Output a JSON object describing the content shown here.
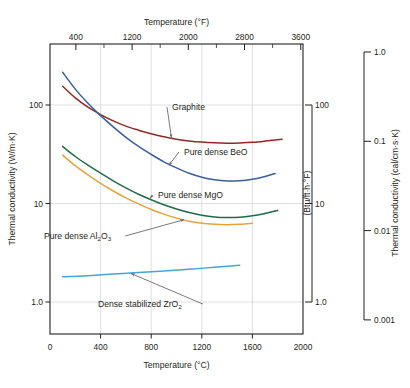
{
  "chart_data": {
    "type": "line",
    "title": "",
    "xlabel": "Temperature (°C)",
    "ylabel": "Thermal conductivity (W/m·K)",
    "xlim": [
      0,
      2000
    ],
    "ylim": [
      0.55,
      400
    ],
    "yscale": "log",
    "grid": true,
    "legend_position": "inline-annotations",
    "axes": {
      "bottom": {
        "label": "Temperature (°C)",
        "ticks": [
          0,
          400,
          800,
          1200,
          1600,
          2000
        ],
        "tick_labels": [
          "0",
          "400",
          "800",
          "1200",
          "1600",
          "2000"
        ]
      },
      "top": {
        "label": "Temperature (°F)",
        "ticks": [
          400,
          1200,
          2000,
          2800,
          3600
        ],
        "tick_labels": [
          "400",
          "1200",
          "2000",
          "2800",
          "3600"
        ],
        "minor_ticks": [
          800,
          1600,
          2400,
          3200
        ]
      },
      "left": {
        "label": "Thermal conductivity (W/m·K)",
        "ticks": [
          100,
          10,
          1.0
        ],
        "tick_labels": [
          "100",
          "10",
          "1.0"
        ]
      },
      "right_inner": {
        "label": "(Btu/ft·h·°F)",
        "ticks": [
          100,
          10,
          1.0
        ],
        "tick_labels": [
          "100",
          "10",
          "1.0"
        ]
      },
      "right_outer": {
        "label": "Thermal conductivity (cal/cm·s·K)",
        "ticks": [
          1.0,
          0.1,
          0.01,
          0.001
        ],
        "tick_labels": [
          "1.0",
          "0.1",
          "0.01",
          "0.001"
        ]
      }
    },
    "series": [
      {
        "name": "Graphite",
        "label": "Graphite",
        "color": "#8e2b24",
        "x": [
          100,
          200,
          300,
          400,
          500,
          600,
          700,
          800,
          900,
          1000,
          1100,
          1200,
          1300,
          1400,
          1500,
          1600,
          1700,
          1835
        ],
        "y": [
          155,
          118,
          95,
          80,
          69,
          61,
          55.5,
          51,
          47.5,
          45,
          43.2,
          42,
          41.3,
          41,
          41.2,
          41.8,
          43,
          45
        ]
      },
      {
        "name": "Pure dense BeO",
        "label": "Pure dense BeO",
        "color": "#3a5f9e",
        "x": [
          100,
          200,
          300,
          400,
          500,
          600,
          700,
          800,
          900,
          1000,
          1100,
          1200,
          1300,
          1400,
          1500,
          1600,
          1700,
          1780
        ],
        "y": [
          215,
          145,
          104,
          78,
          60,
          47,
          38,
          31.5,
          26.5,
          23,
          20.3,
          18.5,
          17.4,
          16.9,
          17.0,
          17.6,
          18.8,
          20.2
        ]
      },
      {
        "name": "Pure dense MgO",
        "label": "Pure dense MgO",
        "color": "#1f6b45",
        "x": [
          100,
          200,
          300,
          400,
          500,
          600,
          700,
          800,
          900,
          1000,
          1100,
          1200,
          1300,
          1400,
          1500,
          1600,
          1700,
          1800
        ],
        "y": [
          38,
          30,
          24.5,
          20.3,
          17.0,
          14.4,
          12.4,
          10.9,
          9.7,
          8.8,
          8.1,
          7.6,
          7.3,
          7.2,
          7.25,
          7.5,
          7.9,
          8.5
        ]
      },
      {
        "name": "Pure dense Al2O3",
        "label": "Pure dense Al₂O₃",
        "label_base": "Pure dense Al",
        "label_sub1": "2",
        "label_mid": "O",
        "label_sub2": "3",
        "color": "#e8a33d",
        "x": [
          100,
          200,
          300,
          400,
          500,
          600,
          700,
          800,
          900,
          1000,
          1100,
          1200,
          1300,
          1400,
          1500,
          1600
        ],
        "y": [
          31,
          24.2,
          19.5,
          16.0,
          13.4,
          11.4,
          9.9,
          8.7,
          7.8,
          7.1,
          6.6,
          6.3,
          6.15,
          6.1,
          6.15,
          6.3
        ]
      },
      {
        "name": "Dense stabilized ZrO2",
        "label": "Dense stabilized ZrO₂",
        "label_base": "Dense stabilized ZrO",
        "label_sub1": "2",
        "color": "#49a3d8",
        "x": [
          100,
          300,
          500,
          700,
          900,
          1100,
          1300,
          1500
        ],
        "y": [
          1.8,
          1.85,
          1.92,
          1.99,
          2.07,
          2.15,
          2.25,
          2.36
        ]
      }
    ],
    "annotations": [
      {
        "text": "Graphite",
        "anchor_x": 960,
        "anchor_y": 46.5,
        "label_x": 172,
        "label_y": 110
      },
      {
        "text": "Pure dense BeO",
        "anchor_x": 940,
        "anchor_y": 24.5,
        "label_x": 184,
        "label_y": 155
      },
      {
        "text": "Pure dense MgO",
        "anchor_x": 790,
        "anchor_y": 11.3,
        "label_x": 158,
        "label_y": 198
      },
      {
        "text": "Pure dense Al2O3",
        "anchor_x": 1060,
        "anchor_y": 6.85,
        "label_x": 44,
        "label_y": 239
      },
      {
        "text": "Dense stabilized ZrO2",
        "anchor_x": 640,
        "anchor_y": 1.95,
        "label_x": 98,
        "label_y": 307
      }
    ]
  }
}
